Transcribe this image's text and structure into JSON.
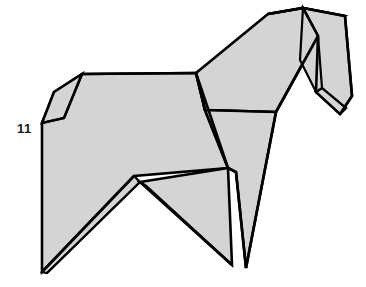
{
  "illustration": {
    "title": "Origami horse folding diagram",
    "subject": "origami-horse",
    "step_number_label": "11",
    "step_number_position": {
      "x": 17,
      "y": 122
    },
    "canvas": {
      "width": 366,
      "height": 287
    },
    "colors": {
      "background": "#ffffff",
      "paper_fill": "#d4d4d4",
      "paper_fill_shadow": "#cbcbcb",
      "outline": "#000000",
      "label_text": "#1a1a1a"
    },
    "stroke_widths": {
      "outline": 2.6,
      "crease": 2.2,
      "thin_crease": 1.8
    },
    "facets": [
      {
        "name": "body-main-panel",
        "fill": "#d4d4d4",
        "stroke_width": 2.6,
        "points": "42,123 54,92 82,74 196,73 205,110 228,168 134,176 42,272"
      },
      {
        "name": "tail-flap",
        "fill": "#d4d4d4",
        "stroke_width": 2.6,
        "points": "42,123 54,92 82,74 64,118"
      },
      {
        "name": "haunch-lower-flap",
        "fill": "#d4d4d4",
        "stroke_width": 2.2,
        "points": "42,272 134,176 140,182 47,273"
      },
      {
        "name": "hind-leg-panel",
        "fill": "#d4d4d4",
        "stroke_width": 2.6,
        "points": "140,182 228,168 232,265 146,186"
      },
      {
        "name": "neck-upper-panel",
        "fill": "#d4d4d4",
        "stroke_width": 2.6,
        "points": "196,73 268,14 303,8 318,36 276,112 205,110"
      },
      {
        "name": "chest-front-panel",
        "fill": "#d4d4d4",
        "stroke_width": 2.6,
        "points": "205,110 276,112 246,268 236,172 228,168"
      },
      {
        "name": "mane-top-flap",
        "fill": "#d4d4d4",
        "stroke_width": 2.6,
        "points": "268,14 303,8 345,16 321,34 303,8"
      },
      {
        "name": "head-panel",
        "fill": "#d4d4d4",
        "stroke_width": 2.6,
        "points": "303,8 345,16 352,96 340,114 316,92 318,36"
      },
      {
        "name": "muzzle-flap",
        "fill": "#d4d4d4",
        "stroke_width": 2.2,
        "points": "316,92 340,114 346,108 322,88"
      },
      {
        "name": "cheek-flap",
        "fill": "#d4d4d4",
        "stroke_width": 2.2,
        "points": "303,8 318,36 322,88 316,92 300,60"
      }
    ],
    "creases": [
      {
        "name": "crease-tail-fold",
        "points": "42,123 64,118 82,74",
        "stroke_width": 2.2
      },
      {
        "name": "crease-back-ridge",
        "points": "82,74 196,73",
        "stroke_width": 2.6
      },
      {
        "name": "crease-shoulder-diagonal",
        "points": "196,73 228,168",
        "stroke_width": 2.6
      },
      {
        "name": "crease-neck-edge",
        "points": "196,73 205,110",
        "stroke_width": 2.6
      },
      {
        "name": "crease-belly-diagonal",
        "points": "42,272 134,176",
        "stroke_width": 2.6
      },
      {
        "name": "crease-belly-inner",
        "points": "47,273 140,182",
        "stroke_width": 1.8
      },
      {
        "name": "crease-hind-leg-front",
        "points": "140,182 232,265",
        "stroke_width": 2.6
      },
      {
        "name": "crease-hind-leg-back",
        "points": "146,186 232,265",
        "stroke_width": 1.8
      },
      {
        "name": "crease-chest-line",
        "points": "228,168 236,172 246,268",
        "stroke_width": 2.6
      },
      {
        "name": "crease-foreleg-edge",
        "points": "276,112 246,268",
        "stroke_width": 2.6
      },
      {
        "name": "crease-neck-back",
        "points": "205,110 276,112",
        "stroke_width": 2.2
      },
      {
        "name": "crease-mane-ridge",
        "points": "268,14 303,8 345,16",
        "stroke_width": 2.6
      },
      {
        "name": "crease-head-front",
        "points": "303,8 318,36 316,92",
        "stroke_width": 2.6
      },
      {
        "name": "crease-head-back",
        "points": "345,16 352,96 340,114",
        "stroke_width": 2.6
      },
      {
        "name": "crease-muzzle",
        "points": "316,92 340,114 346,108 322,88",
        "stroke_width": 2.2
      },
      {
        "name": "crease-neck-inner",
        "points": "318,36 276,112",
        "stroke_width": 2.6
      }
    ]
  }
}
